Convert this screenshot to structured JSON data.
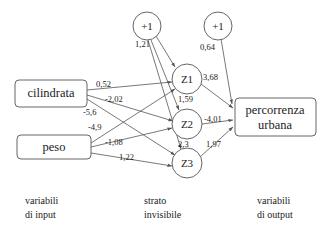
{
  "diagram": {
    "nodes": {
      "bias_hidden": {
        "label": "+1",
        "type": "bias"
      },
      "bias_output": {
        "label": "+1",
        "type": "bias"
      },
      "cilindrata": {
        "label": "cilindrata",
        "type": "input"
      },
      "peso": {
        "label": "peso",
        "type": "input"
      },
      "z1": {
        "label": "Z1",
        "type": "hidden"
      },
      "z2": {
        "label": "Z2",
        "type": "hidden"
      },
      "z3": {
        "label": "Z3",
        "type": "hidden"
      },
      "output": {
        "label_line1": "percorrenza",
        "label_line2": "urbana",
        "type": "output"
      }
    },
    "edges": [
      {
        "id": "bias_hidden-z1",
        "from": "bias_hidden",
        "to": "z1",
        "weight": "1,21"
      },
      {
        "id": "bias_hidden-z2",
        "from": "bias_hidden",
        "to": "z2",
        "weight": "1,59"
      },
      {
        "id": "bias_hidden-z3",
        "from": "bias_hidden",
        "to": "z3",
        "weight": "2,3"
      },
      {
        "id": "cilindrata-z1",
        "from": "cilindrata",
        "to": "z1",
        "weight": "0,52"
      },
      {
        "id": "cilindrata-z2",
        "from": "cilindrata",
        "to": "z2",
        "weight": "-2,02"
      },
      {
        "id": "cilindrata-z3",
        "from": "cilindrata",
        "to": "z3",
        "weight": "-5,6"
      },
      {
        "id": "peso-z1",
        "from": "peso",
        "to": "z1",
        "weight": "-4,9"
      },
      {
        "id": "peso-z2",
        "from": "peso",
        "to": "z2",
        "weight": "-1,08"
      },
      {
        "id": "peso-z3",
        "from": "peso",
        "to": "z3",
        "weight": "1,22"
      },
      {
        "id": "z1-output",
        "from": "z1",
        "to": "output",
        "weight": "3,68"
      },
      {
        "id": "z2-output",
        "from": "z2",
        "to": "output",
        "weight": "-4,01"
      },
      {
        "id": "z3-output",
        "from": "z3",
        "to": "output",
        "weight": "1,97"
      },
      {
        "id": "bias_output-output",
        "from": "bias_output",
        "to": "output",
        "weight": "0,64"
      }
    ],
    "captions": {
      "input": {
        "line1": "variabili",
        "line2": "di input"
      },
      "hidden": {
        "line1": "strato",
        "line2": "invisibile"
      },
      "output": {
        "line1": "variabili",
        "line2": "di output"
      }
    }
  }
}
